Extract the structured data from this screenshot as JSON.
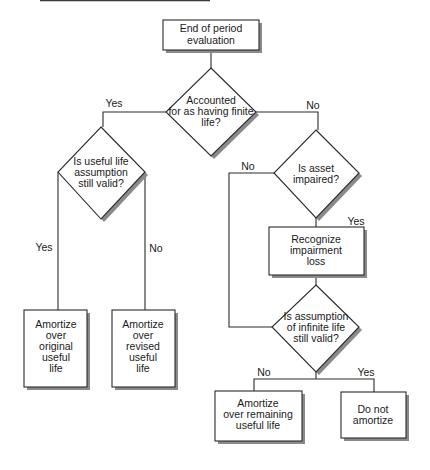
{
  "diagram": {
    "type": "flowchart",
    "colors": {
      "line": "#2a2a2a",
      "shadow": "#8a8a8a",
      "background": "#ffffff",
      "text": "#1a1a1a"
    },
    "nodes": {
      "start": {
        "shape": "rectangle",
        "lines": [
          "End of period",
          "evaluation"
        ]
      },
      "finite_life": {
        "shape": "diamond",
        "lines": [
          "Accounted",
          "for as having finite",
          "life?"
        ]
      },
      "useful_life_valid": {
        "shape": "diamond",
        "lines": [
          "Is useful life",
          "assumption",
          "still valid?"
        ]
      },
      "amortize_original": {
        "shape": "rectangle",
        "lines": [
          "Amortize",
          "over",
          "original",
          "useful",
          "life"
        ]
      },
      "amortize_revised": {
        "shape": "rectangle",
        "lines": [
          "Amortize",
          "over",
          "revised",
          "useful",
          "life"
        ]
      },
      "asset_impaired": {
        "shape": "diamond",
        "lines": [
          "Is asset",
          "impaired?"
        ]
      },
      "recognize_impairment": {
        "shape": "rectangle",
        "lines": [
          "Recognize",
          "impairment",
          "loss"
        ]
      },
      "infinite_life_valid": {
        "shape": "diamond",
        "lines": [
          "Is assumption",
          "of infinite life",
          "still valid?"
        ]
      },
      "amortize_remaining": {
        "shape": "rectangle",
        "lines": [
          "Amortize",
          "over remaining",
          "useful life"
        ]
      },
      "do_not_amortize": {
        "shape": "rectangle",
        "lines": [
          "Do not",
          "amortize"
        ]
      }
    },
    "edge_labels": {
      "finite_yes": "Yes",
      "finite_no": "No",
      "useful_yes": "Yes",
      "useful_no": "No",
      "impaired_no": "No",
      "impaired_yes": "Yes",
      "infinite_no": "No",
      "infinite_yes": "Yes"
    },
    "edges": [
      {
        "from": "start",
        "to": "finite_life",
        "label": ""
      },
      {
        "from": "finite_life",
        "to": "useful_life_valid",
        "label": "Yes"
      },
      {
        "from": "finite_life",
        "to": "asset_impaired",
        "label": "No"
      },
      {
        "from": "useful_life_valid",
        "to": "amortize_original",
        "label": "Yes"
      },
      {
        "from": "useful_life_valid",
        "to": "amortize_revised",
        "label": "No"
      },
      {
        "from": "asset_impaired",
        "to": "recognize_impairment",
        "label": "Yes"
      },
      {
        "from": "asset_impaired",
        "to": "infinite_life_valid",
        "label": "No"
      },
      {
        "from": "recognize_impairment",
        "to": "infinite_life_valid",
        "label": ""
      },
      {
        "from": "infinite_life_valid",
        "to": "amortize_remaining",
        "label": "No"
      },
      {
        "from": "infinite_life_valid",
        "to": "do_not_amortize",
        "label": "Yes"
      }
    ]
  }
}
